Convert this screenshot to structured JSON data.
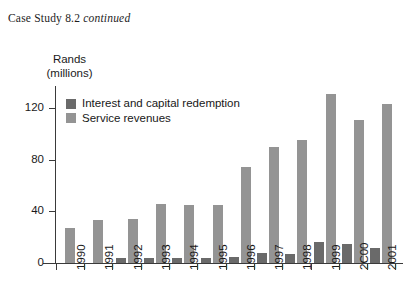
{
  "header": {
    "text": "Case Study 8.2 ",
    "emphasis": "continued"
  },
  "chart_data": {
    "type": "bar",
    "title": "",
    "xlabel": "",
    "ylabel": "Rands (millions)",
    "ylabel_line1": "Rands",
    "ylabel_line2": "(millions)",
    "ylim": [
      0,
      140
    ],
    "yticks": [
      0,
      40,
      80,
      120
    ],
    "ytick_labels": [
      "0",
      "40",
      "80",
      "120"
    ],
    "grid": false,
    "legend_position": "top-left",
    "categories": [
      "1990",
      "1991",
      "1992",
      "1993",
      "1994",
      "1995",
      "1996",
      "1997",
      "1998",
      "1999",
      "2C00",
      "2001"
    ],
    "series": [
      {
        "name": "Interest and capital redemption",
        "color": "#6a6a6a",
        "values": [
          0,
          0,
          4,
          4,
          4,
          4,
          5,
          8,
          7,
          16,
          15,
          12
        ]
      },
      {
        "name": "Service revenues",
        "color": "#949494",
        "values": [
          27,
          33,
          34,
          46,
          45,
          45,
          74,
          90,
          95,
          131,
          111,
          123
        ]
      }
    ]
  },
  "colors": {
    "axis": "#3a3a3a",
    "text": "#1a1a1a",
    "series_dark": "#6a6a6a",
    "series_light": "#949494",
    "background": "#ffffff"
  }
}
